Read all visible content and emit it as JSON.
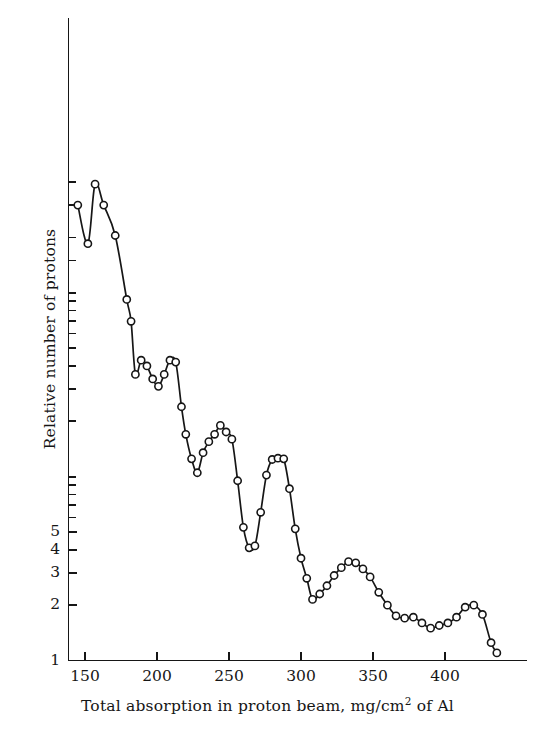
{
  "figure": {
    "kind": "scientific-line-plot",
    "background_color": "#ffffff",
    "ink_color": "#161616"
  },
  "chart_data": {
    "type": "line",
    "title": "",
    "subtitle": "",
    "xlabel": "Total absorption in proton beam, mg/cm2 of Al",
    "xlabel_parts": {
      "before_superscript": "Total absorption in proton beam, mg/cm",
      "superscript": "2",
      "after_superscript": " of Al"
    },
    "ylabel": "Relative number of protons",
    "xscale": "linear",
    "yscale": "log",
    "xlim": [
      141,
      437
    ],
    "ylim": [
      1,
      430
    ],
    "grid": false,
    "legend": null,
    "marker": "open-circle",
    "line_style": "solid-smooth",
    "xticks": [
      150,
      200,
      250,
      300,
      350,
      400
    ],
    "xtick_labels": [
      "150",
      "200",
      "250",
      "300",
      "350",
      "400"
    ],
    "yticks_labeled": [
      1,
      2,
      3,
      4,
      5
    ],
    "ytick_labels": [
      "1",
      "2",
      "3",
      "4",
      "5"
    ],
    "yticks_unlabeled_note": "logarithmic decade and sub-decade ticks continue unlabeled above 5",
    "series": [
      {
        "name": "Relative number of protons",
        "x": [
          145,
          152,
          157,
          163,
          171,
          179,
          182,
          185,
          189,
          193,
          197,
          201,
          205,
          209,
          213,
          217,
          220,
          224,
          228,
          232,
          236,
          240,
          244,
          248,
          252,
          256,
          260,
          264,
          268,
          272,
          276,
          280,
          284,
          288,
          292,
          296,
          300,
          304,
          308,
          313,
          318,
          323,
          328,
          333,
          338,
          343,
          348,
          354,
          360,
          366,
          372,
          378,
          384,
          390,
          396,
          402,
          408,
          414,
          420,
          426,
          432,
          436
        ],
        "y": [
          300,
          185,
          390,
          300,
          205,
          92,
          70,
          36,
          43,
          40,
          34,
          31,
          36,
          43,
          42,
          24,
          17,
          12.5,
          10.5,
          13.5,
          15.5,
          17,
          19,
          17.5,
          16,
          9.5,
          5.3,
          4.1,
          4.2,
          6.4,
          10.2,
          12.4,
          12.6,
          12.5,
          8.6,
          5.2,
          3.6,
          2.8,
          2.15,
          2.3,
          2.55,
          2.9,
          3.2,
          3.45,
          3.4,
          3.15,
          2.85,
          2.35,
          2.0,
          1.75,
          1.7,
          1.72,
          1.6,
          1.5,
          1.55,
          1.6,
          1.72,
          1.95,
          2.0,
          1.78,
          1.25,
          1.1
        ]
      }
    ],
    "annotations": []
  }
}
